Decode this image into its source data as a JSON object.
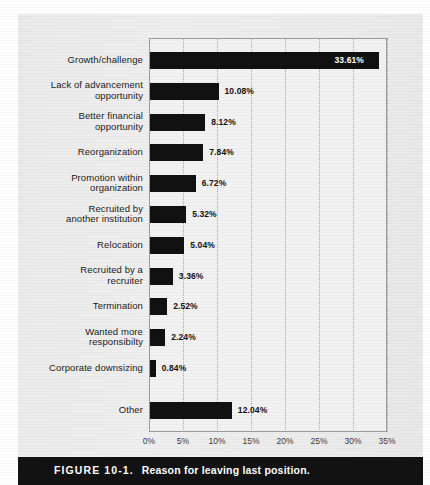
{
  "figure": {
    "label": "FIGURE 10-1.",
    "title": "Reason for leaving last position."
  },
  "chart_data": {
    "type": "bar",
    "orientation": "horizontal",
    "title": "Reason for leaving last position.",
    "xlabel": "",
    "ylabel": "",
    "xlim": [
      0,
      35
    ],
    "xticks": [
      "0%",
      "5%",
      "10%",
      "15%",
      "20%",
      "25%",
      "30%",
      "35%"
    ],
    "xtick_values": [
      0,
      5,
      10,
      15,
      20,
      25,
      30,
      35
    ],
    "grid": "vertical-dotted",
    "legend": "none",
    "bar_color": "#111111",
    "categories": [
      "Growth/challenge",
      "Lack of advancement\nopportunity",
      "Better financial\nopportunity",
      "Reorganization",
      "Promotion within\norganization",
      "Recruited by\nanother institution",
      "Relocation",
      "Recruited by a\nrecruiter",
      "Termination",
      "Wanted more\nresponsibilty",
      "Corporate downsizing",
      "Other"
    ],
    "values": [
      33.61,
      10.08,
      8.12,
      7.84,
      6.72,
      5.32,
      5.04,
      3.36,
      2.52,
      2.24,
      0.84,
      12.04
    ],
    "value_labels": [
      "33.61%",
      "10.08%",
      "8.12%",
      "7.84%",
      "6.72%",
      "5.32%",
      "5.04%",
      "3.36%",
      "2.52%",
      "2.24%",
      "0.84%",
      "12.04%"
    ],
    "label_placement": [
      "inside",
      "outside",
      "outside",
      "outside",
      "outside",
      "outside",
      "outside",
      "outside",
      "outside",
      "outside",
      "outside",
      "outside"
    ]
  }
}
